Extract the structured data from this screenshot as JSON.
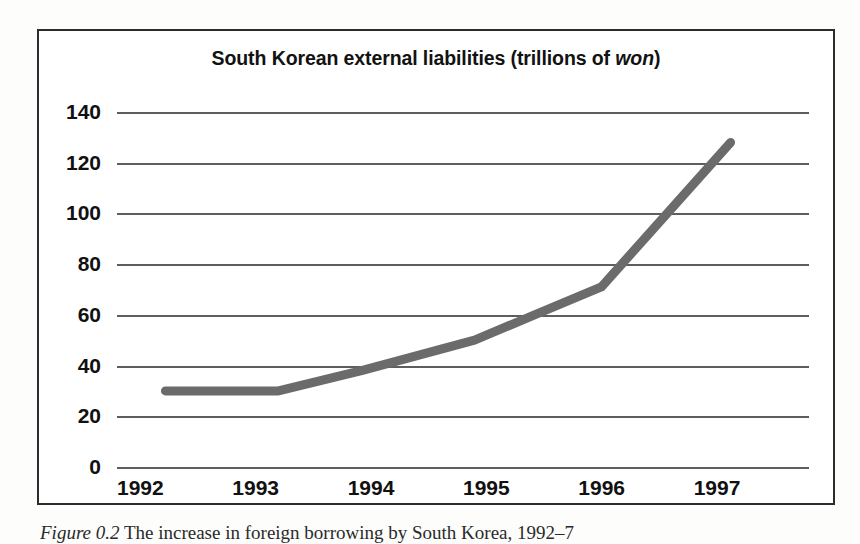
{
  "figure": {
    "title_prefix": "South Korean external liabilities (trillions of ",
    "title_italic": "won",
    "title_suffix": ")",
    "caption_italic": "Figure 0.2",
    "caption_text": " The increase in foreign borrowing by South Korea, 1992–7"
  },
  "colors": {
    "line": "#6b6b6b",
    "gridline": "#5e5e5e",
    "frame": "#2c2c2c",
    "text": "#111111",
    "background": "#ffffff"
  },
  "chart_data": {
    "type": "line",
    "title": "South Korean external liabilities (trillions of won)",
    "xlabel": "",
    "ylabel": "",
    "ylim": [
      0,
      140
    ],
    "xlim": [
      1992,
      1998
    ],
    "ytick_labels": [
      "0",
      "20",
      "40",
      "60",
      "80",
      "100",
      "120",
      "140"
    ],
    "ytick_values": [
      0,
      20,
      40,
      60,
      80,
      100,
      120,
      140
    ],
    "xtick_labels": [
      "1992",
      "1993",
      "1994",
      "1995",
      "1996",
      "1997"
    ],
    "xtick_values": [
      1992,
      1993,
      1994,
      1995,
      1996,
      1997
    ],
    "grid": "horizontal",
    "legend": "none",
    "series": [
      {
        "name": "South Korean external liabilities",
        "unit": "trillions of won",
        "x": [
          1992.42,
          1993.4,
          1994.12,
          1995.1,
          1995.62,
          1996.2,
          1997.32
        ],
        "values": [
          30,
          30,
          38,
          50,
          60,
          71,
          128
        ]
      }
    ]
  }
}
